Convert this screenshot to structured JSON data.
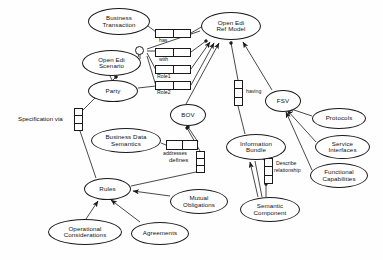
{
  "diagram": {
    "background_color": "#fefefe",
    "line_color": "#1a1a1a",
    "text_color": "#111111",
    "nodes": [
      {
        "id": "business-transaction",
        "label": "Business Transaction",
        "line1": "Business",
        "line2": "Transaction",
        "x": 88,
        "y": 8,
        "w": 62,
        "h": 27
      },
      {
        "id": "open-edi-ref-model",
        "label": "Open Edi Ref Model",
        "line1": "Open Edi",
        "line2": "Ref Model",
        "x": 201,
        "y": 12,
        "w": 60,
        "h": 28
      },
      {
        "id": "open-edi-scenario",
        "label": "Open Edi Scenario",
        "line1": "Open Edi",
        "line2": "Scenario",
        "x": 82,
        "y": 50,
        "w": 59,
        "h": 26
      },
      {
        "id": "party",
        "label": "Party",
        "line1": "Party",
        "line2": "",
        "x": 88,
        "y": 80,
        "w": 50,
        "h": 22
      },
      {
        "id": "bov",
        "label": "BOV",
        "line1": "BOV",
        "line2": "",
        "x": 170,
        "y": 104,
        "w": 36,
        "h": 22
      },
      {
        "id": "fsv",
        "label": "FSV",
        "line1": "FSV",
        "line2": "",
        "x": 265,
        "y": 90,
        "w": 36,
        "h": 22
      },
      {
        "id": "protocols",
        "label": "Protocols",
        "line1": "Protocols",
        "line2": "",
        "x": 312,
        "y": 108,
        "w": 54,
        "h": 21
      },
      {
        "id": "service-interfaces",
        "label": "Service Interfaces",
        "line1": "Service",
        "line2": "Interfaces",
        "x": 315,
        "y": 135,
        "w": 55,
        "h": 24
      },
      {
        "id": "functional-capabilities",
        "label": "Functional Capabilities",
        "line1": "Functional",
        "line2": "Capabilities",
        "x": 310,
        "y": 163,
        "w": 58,
        "h": 25
      },
      {
        "id": "business-data-semantics",
        "label": "Business Data Semantics",
        "line1": "Business Data",
        "line2": "Semantics",
        "x": 91,
        "y": 128,
        "w": 70,
        "h": 25
      },
      {
        "id": "information-bundle",
        "label": "Information Bundle",
        "line1": "Information",
        "line2": "Bundle",
        "x": 226,
        "y": 134,
        "w": 60,
        "h": 26
      },
      {
        "id": "rules",
        "label": "Rules",
        "line1": "Rules",
        "line2": "",
        "x": 84,
        "y": 178,
        "w": 47,
        "h": 22
      },
      {
        "id": "mutual-obligations",
        "label": "Mutual Obligations",
        "line1": "Mutual",
        "line2": "Obligations",
        "x": 170,
        "y": 189,
        "w": 58,
        "h": 25
      },
      {
        "id": "semantic-component",
        "label": "Semantic Component",
        "line1": "Semantic",
        "line2": "Component",
        "x": 240,
        "y": 197,
        "w": 60,
        "h": 25
      },
      {
        "id": "operational-considerations",
        "label": "Operational Considerations",
        "line1": "Operational",
        "line2": "Considerations",
        "x": 48,
        "y": 219,
        "w": 74,
        "h": 26
      },
      {
        "id": "agreements",
        "label": "Agreements",
        "line1": "Agreements",
        "line2": "",
        "x": 131,
        "y": 222,
        "w": 58,
        "h": 23
      }
    ],
    "association_boxes": [
      {
        "id": "assoc-has",
        "orient": "h",
        "cells": 2,
        "x": 155,
        "y": 29,
        "w": 36,
        "h": 9
      },
      {
        "id": "assoc-with",
        "orient": "h",
        "cells": 2,
        "x": 155,
        "y": 48,
        "w": 36,
        "h": 9
      },
      {
        "id": "assoc-role1",
        "orient": "h",
        "cells": 2,
        "x": 155,
        "y": 65,
        "w": 36,
        "h": 9
      },
      {
        "id": "assoc-role2",
        "orient": "h",
        "cells": 2,
        "x": 155,
        "y": 81,
        "w": 36,
        "h": 9
      },
      {
        "id": "assoc-having",
        "orient": "v",
        "cells": 3,
        "x": 234,
        "y": 80,
        "w": 9,
        "h": 26
      },
      {
        "id": "assoc-specification-via",
        "orient": "v",
        "cells": 3,
        "x": 74,
        "y": 108,
        "w": 9,
        "h": 23
      },
      {
        "id": "assoc-addresses",
        "orient": "h",
        "cells": 2,
        "x": 166,
        "y": 140,
        "w": 32,
        "h": 10
      },
      {
        "id": "assoc-defines",
        "orient": "v",
        "cells": 3,
        "x": 196,
        "y": 151,
        "w": 9,
        "h": 22
      },
      {
        "id": "assoc-describe-relationship",
        "orient": "v",
        "cells": 3,
        "x": 264,
        "y": 158,
        "w": 9,
        "h": 26
      }
    ],
    "edge_labels": [
      {
        "id": "label-has",
        "text": "has",
        "x": 159,
        "y": 39
      },
      {
        "id": "label-with",
        "text": "with",
        "x": 159,
        "y": 58
      },
      {
        "id": "label-role1",
        "text": "Role1",
        "x": 157,
        "y": 75
      },
      {
        "id": "label-role2",
        "text": "Role2",
        "x": 157,
        "y": 91
      },
      {
        "id": "label-having",
        "text": "having",
        "x": 246,
        "y": 90
      },
      {
        "id": "label-addresses",
        "text": "addresses",
        "x": 164,
        "y": 151
      },
      {
        "id": "label-defines",
        "text": "defines",
        "x": 169,
        "y": 158
      },
      {
        "id": "label-describe-relationship-1",
        "text": "Describe",
        "x": 276,
        "y": 162
      },
      {
        "id": "label-describe-relationship-2",
        "text": "relationship",
        "x": 274,
        "y": 169
      }
    ],
    "plain_labels": [
      {
        "id": "label-specification-via",
        "text": "Specification via",
        "x": 18,
        "y": 116
      }
    ],
    "junctions": [
      {
        "id": "junction-scenario-fan",
        "x": 139,
        "y": 50
      }
    ],
    "relationships": [
      {
        "from": "business-transaction",
        "to": "assoc-has",
        "label": "has"
      },
      {
        "from": "assoc-has",
        "to": "open-edi-ref-model",
        "label": ""
      },
      {
        "from": "junction-scenario-fan",
        "to": "assoc-with",
        "label": "with"
      },
      {
        "from": "junction-scenario-fan",
        "to": "assoc-role1",
        "label": "Role1"
      },
      {
        "from": "party",
        "to": "assoc-role2",
        "label": "Role2"
      },
      {
        "from": "open-edi-scenario",
        "to": "junction-scenario-fan",
        "label": ""
      },
      {
        "from": "bov",
        "to": "open-edi-ref-model",
        "label": ""
      },
      {
        "from": "fsv",
        "to": "open-edi-ref-model",
        "label": ""
      },
      {
        "from": "assoc-having",
        "to": "open-edi-ref-model",
        "label": "having"
      },
      {
        "from": "information-bundle",
        "to": "assoc-having",
        "label": ""
      },
      {
        "from": "protocols",
        "to": "fsv",
        "label": ""
      },
      {
        "from": "service-interfaces",
        "to": "fsv",
        "label": ""
      },
      {
        "from": "functional-capabilities",
        "to": "fsv",
        "label": ""
      },
      {
        "from": "business-data-semantics",
        "to": "assoc-addresses",
        "label": "addresses"
      },
      {
        "from": "assoc-addresses",
        "to": "bov",
        "label": ""
      },
      {
        "from": "assoc-defines",
        "to": "bov",
        "label": "defines"
      },
      {
        "from": "rules",
        "to": "assoc-defines",
        "label": ""
      },
      {
        "from": "operational-considerations",
        "to": "rules",
        "label": ""
      },
      {
        "from": "agreements",
        "to": "rules",
        "label": ""
      },
      {
        "from": "mutual-obligations",
        "to": "rules",
        "label": ""
      },
      {
        "from": "semantic-component",
        "to": "information-bundle",
        "label": ""
      },
      {
        "from": "semantic-component",
        "to": "assoc-describe-relationship",
        "label": "Describe relationship"
      },
      {
        "from": "assoc-specification-via",
        "to": "rules",
        "label": "Specification via"
      },
      {
        "from": "assoc-specification-via",
        "to": "open-edi-scenario",
        "label": ""
      }
    ]
  }
}
